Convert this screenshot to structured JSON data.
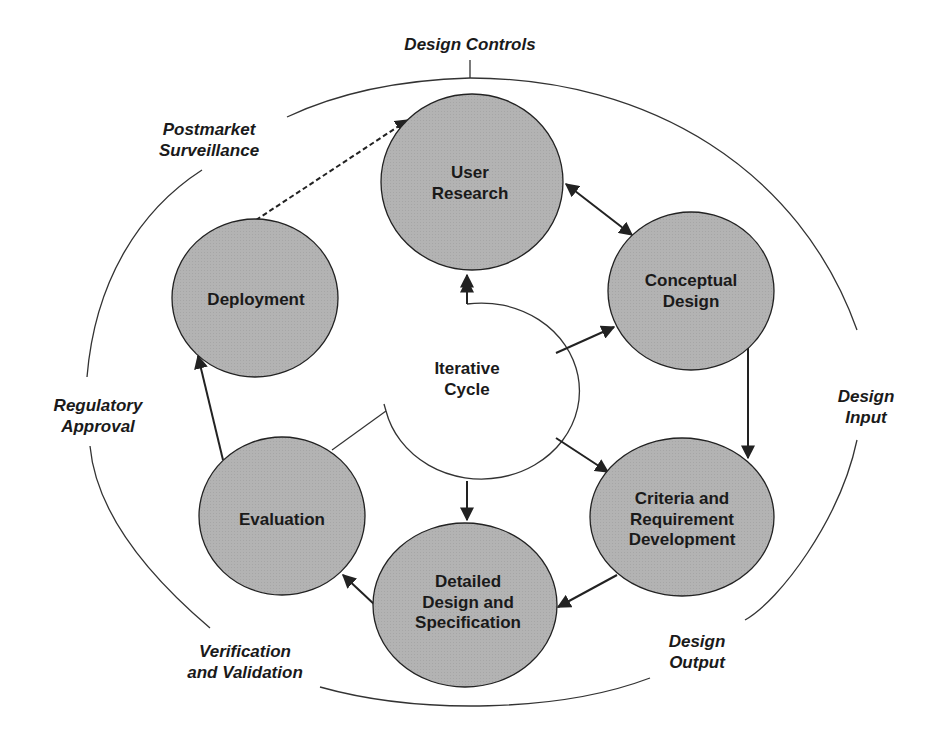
{
  "diagram": {
    "colors": {
      "node_fill": "#b3b3b3",
      "stroke": "#222222",
      "background": "#ffffff"
    },
    "center": {
      "label_line1": "Iterative",
      "label_line2": "Cycle"
    },
    "nodes": [
      {
        "id": "user-research",
        "line1": "User",
        "line2": "Research"
      },
      {
        "id": "conceptual-design",
        "line1": "Conceptual",
        "line2": "Design"
      },
      {
        "id": "criteria",
        "line1": "Criteria and",
        "line2": "Requirement",
        "line3": "Development"
      },
      {
        "id": "detailed-design",
        "line1": "Detailed",
        "line2": "Design and",
        "line3": "Specification"
      },
      {
        "id": "evaluation",
        "line1": "Evaluation"
      },
      {
        "id": "deployment",
        "line1": "Deployment"
      }
    ],
    "phases": [
      {
        "id": "design-controls",
        "line1": "Design Controls"
      },
      {
        "id": "design-input",
        "line1": "Design",
        "line2": "Input"
      },
      {
        "id": "design-output",
        "line1": "Design",
        "line2": "Output"
      },
      {
        "id": "verification",
        "line1": "Verification",
        "line2": "and Validation"
      },
      {
        "id": "regulatory",
        "line1": "Regulatory",
        "line2": "Approval"
      },
      {
        "id": "postmarket",
        "line1": "Postmarket",
        "line2": "Surveillance"
      }
    ]
  }
}
